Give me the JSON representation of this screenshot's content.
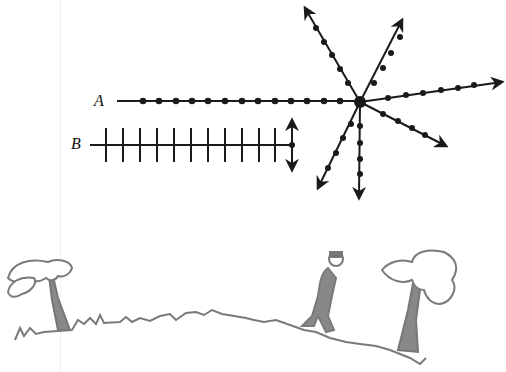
{
  "diagram": {
    "labels": {
      "a": "A",
      "b": "B"
    },
    "colors": {
      "ink": "#1a1a1a",
      "landscape": "#808080"
    },
    "wave_a": {
      "type": "longitudinal-dots-line",
      "start_x": 117,
      "end_x": 360,
      "y": 101,
      "dot_count": 13
    },
    "wave_b": {
      "type": "transverse-ticks-line",
      "start_x": 90,
      "end_x": 292,
      "y": 145,
      "tick_count": 11,
      "arrow": "vertical-double"
    },
    "starburst": {
      "center": [
        360,
        102
      ],
      "rays": 8
    },
    "landscape": {
      "items": [
        "tree-left",
        "grass-hill",
        "man-figure",
        "tree-right"
      ]
    }
  }
}
